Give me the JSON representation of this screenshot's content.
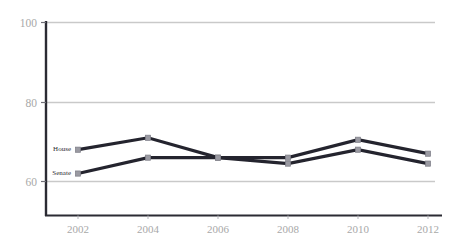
{
  "chart_data": {
    "type": "line",
    "title": "",
    "subtitle": "",
    "xlabel": "",
    "ylabel": "",
    "categories": [
      "2002",
      "2004",
      "2006",
      "2008",
      "2010",
      "2012"
    ],
    "x": [
      2002,
      2004,
      2006,
      2008,
      2010,
      2012
    ],
    "series": [
      {
        "name": "House",
        "color": "#24242e",
        "marker": "square",
        "marker_color": "#9a9aa2",
        "values": [
          68,
          71,
          66,
          66,
          70.5,
          67
        ]
      },
      {
        "name": "Senate",
        "color": "#24242e",
        "marker": "square",
        "marker_color": "#9a9aa2",
        "values": [
          62,
          66,
          66,
          64.5,
          68,
          64.5
        ]
      }
    ],
    "ylim": [
      50,
      100
    ],
    "yticks": [
      60,
      80,
      100
    ],
    "ytick_labels": [
      "60",
      "80",
      "100"
    ],
    "xtick_labels": [
      "2002",
      "2004",
      "2006",
      "2008",
      "2010",
      "2012"
    ],
    "grid": true,
    "grid_axis": "y",
    "grid_color": "#c9c9c9",
    "legend": "inline-left",
    "axis_color": "#2b2b33",
    "tick_label_color": "#a8a8a8"
  },
  "axes": {
    "y_ticks": [
      {
        "label": "100",
        "value": 100
      },
      {
        "label": "80",
        "value": 80
      },
      {
        "label": "60",
        "value": 60
      }
    ],
    "x_ticks": [
      {
        "label": "2002",
        "value": 2002
      },
      {
        "label": "2004",
        "value": 2004
      },
      {
        "label": "2006",
        "value": 2006
      },
      {
        "label": "2008",
        "value": 2008
      },
      {
        "label": "2010",
        "value": 2010
      },
      {
        "label": "2012",
        "value": 2012
      }
    ]
  },
  "series_labels": [
    {
      "label": "House"
    },
    {
      "label": "Senate"
    }
  ]
}
